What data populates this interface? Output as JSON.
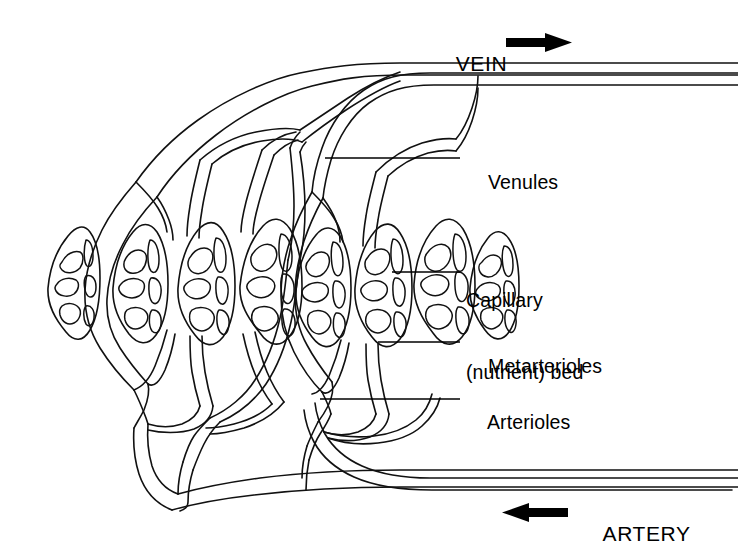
{
  "figure": {
    "kind": "anatomy-diagram",
    "background_color": "#ffffff",
    "ink_color": "#111111"
  },
  "flow_labels": [
    {
      "id": "vein",
      "text": "VEIN",
      "arrow_icon": "arrow-right-icon",
      "arrow_direction": "right",
      "x": 430,
      "y": 28
    },
    {
      "id": "artery",
      "text": "ARTERY",
      "arrow_icon": "arrow-left-icon",
      "arrow_direction": "left",
      "x": 578,
      "y": 498
    }
  ],
  "callouts": [
    {
      "id": "venules",
      "text": "Venules",
      "lines": [
        "Venules"
      ],
      "text_x": 466,
      "text_y": 146,
      "leader_from_x": 325,
      "leader_from_y": 158,
      "leader_to_x": 460,
      "leader_to_y": 158
    },
    {
      "id": "capillary-bed",
      "text": "Capillary (nutrient) bed",
      "lines": [
        "Capillary",
        "(nutrient) bed"
      ],
      "text_x": 466,
      "text_y": 240,
      "leader_from_x": 392,
      "leader_from_y": 272,
      "leader_to_x": 460,
      "leader_to_y": 272
    },
    {
      "id": "metarterioles",
      "text": "Metarterioles",
      "lines": [
        "Metarterioles"
      ],
      "text_x": 466,
      "text_y": 330,
      "leader_from_x": 378,
      "leader_from_y": 342,
      "leader_to_x": 460,
      "leader_to_y": 342
    },
    {
      "id": "arterioles",
      "text": "Arterioles",
      "lines": [
        "Arterioles"
      ],
      "text_x": 466,
      "text_y": 386,
      "leader_from_x": 320,
      "leader_from_y": 399,
      "leader_to_x": 460,
      "leader_to_y": 399
    }
  ],
  "structure": {
    "capillary_lobe_count": 8,
    "cluster_count": 2,
    "lobes_per_cluster": 4,
    "vein_trunk_label": "vein-trunk",
    "artery_trunk_label": "artery-trunk"
  }
}
